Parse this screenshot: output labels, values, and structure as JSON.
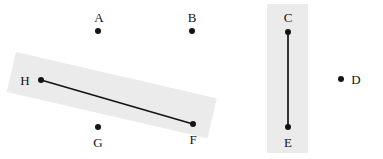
{
  "figure": {
    "type": "geometry-point-diagram",
    "width": 383,
    "height": 159,
    "background_color": "#ffffff",
    "point_color": "#141414",
    "edge_color": "#141414",
    "band_color": "#ebebeb"
  },
  "points": [
    {
      "id": "A",
      "label": "A",
      "x": 98,
      "y": 31,
      "label_x": 99,
      "label_y": 17
    },
    {
      "id": "B",
      "label": "B",
      "x": 192,
      "y": 31,
      "label_x": 192,
      "label_y": 17
    },
    {
      "id": "C",
      "label": "C",
      "x": 288,
      "y": 32,
      "label_x": 288,
      "label_y": 17
    },
    {
      "id": "D",
      "label": "D",
      "x": 341,
      "y": 79,
      "label_x": 356,
      "label_y": 79
    },
    {
      "id": "E",
      "label": "E",
      "x": 288,
      "y": 127,
      "label_x": 288,
      "label_y": 142
    },
    {
      "id": "F",
      "label": "F",
      "x": 193,
      "y": 124,
      "label_x": 193,
      "label_y": 139
    },
    {
      "id": "G",
      "label": "G",
      "x": 98,
      "y": 127,
      "label_x": 98,
      "label_y": 142
    },
    {
      "id": "H",
      "label": "H",
      "x": 41,
      "y": 80,
      "label_x": 25,
      "label_y": 80
    }
  ],
  "edges": [
    {
      "id": "HF",
      "from": "H",
      "to": "F",
      "x1": 41,
      "y1": 80,
      "x2": 193,
      "y2": 124
    },
    {
      "id": "CE",
      "from": "C",
      "to": "E",
      "x1": 288,
      "y1": 32,
      "x2": 288,
      "y2": 127
    }
  ],
  "bands": [
    {
      "id": "band-hf",
      "orientation": "diagonal",
      "rotation_deg": 13,
      "covers": [
        "H",
        "F"
      ]
    },
    {
      "id": "band-ce",
      "orientation": "vertical",
      "rotation_deg": 0,
      "covers": [
        "C",
        "E"
      ]
    }
  ]
}
